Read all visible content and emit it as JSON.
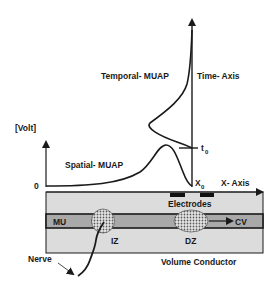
{
  "diagram": {
    "labels": {
      "temporal_muap": "Temporal- MUAP",
      "time_axis": "Time- Axis",
      "volt_axis": "[Volt]",
      "spatial_muap": "Spatial- MUAP",
      "zero": "0",
      "t0_main": "t",
      "t0_sub": "0",
      "x0_main": "X",
      "x0_sub": "0",
      "x_axis": "X- Axis",
      "electrodes": "Electrodes",
      "mu": "MU",
      "cv": "CV",
      "iz": "IZ",
      "dz": "DZ",
      "nerve": "Nerve",
      "volume_conductor": "Volume Conductor"
    },
    "colors": {
      "line": "#1a1a1a",
      "volume_conductor_fill": "#dcdcdc",
      "muscle_unit_fill": "#a9a9a9",
      "zone_fill": "#c8c8c8",
      "electrode_fill": "#111111",
      "background": "#ffffff"
    }
  }
}
